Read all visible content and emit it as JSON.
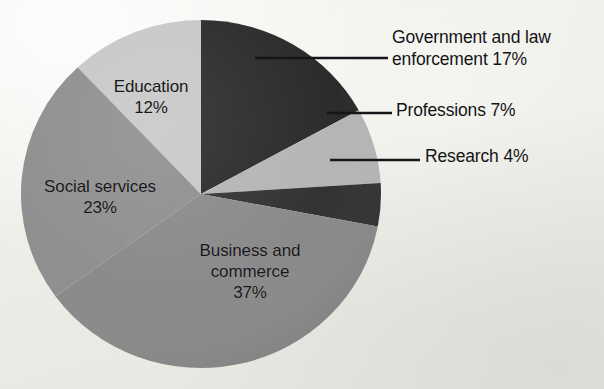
{
  "figure": {
    "background_color": "#efefea",
    "text_color": "#17171a"
  },
  "chart_data": {
    "type": "pie",
    "title": "",
    "subtitle": "",
    "xlabel": "",
    "ylabel": "",
    "legend_position": "none",
    "grid": false,
    "units": "percent",
    "total": 100,
    "start_angle_deg": 0,
    "direction": "clockwise",
    "categories": [
      "Government and law enforcement",
      "Professions",
      "Research",
      "Business and commerce",
      "Social services",
      "Education"
    ],
    "values": [
      17,
      7,
      4,
      37,
      23,
      12
    ],
    "colors": [
      "#2b2b2b",
      "#b5b5b5",
      "#333333",
      "#8a8a8a",
      "#8f8f8f",
      "#c8c8c8"
    ],
    "slices": [
      {
        "name": "Government and law enforcement",
        "value": 17,
        "label": "Government and law\nenforcement 17%",
        "percent_text": "17%",
        "color": "#2b2b2b",
        "label_placement": "callout-right",
        "start_deg": 0,
        "end_deg": 61.2
      },
      {
        "name": "Professions",
        "value": 7,
        "label": "Professions 7%",
        "percent_text": "7%",
        "color": "#b5b5b5",
        "label_placement": "callout-right",
        "start_deg": 61.2,
        "end_deg": 86.4
      },
      {
        "name": "Research",
        "value": 4,
        "label": "Research 4%",
        "percent_text": "4%",
        "color": "#333333",
        "label_placement": "callout-right",
        "start_deg": 86.4,
        "end_deg": 100.8
      },
      {
        "name": "Business and commerce",
        "value": 37,
        "label": "Business and\ncommerce\n37%",
        "percent_text": "37%",
        "color": "#8a8a8a",
        "label_placement": "inside",
        "start_deg": 100.8,
        "end_deg": 234.0
      },
      {
        "name": "Social services",
        "value": 23,
        "label": "Social services\n23%",
        "percent_text": "23%",
        "color": "#8f8f8f",
        "label_placement": "inside",
        "start_deg": 234.0,
        "end_deg": 316.8
      },
      {
        "name": "Education",
        "value": 12,
        "label": "Education\n12%",
        "percent_text": "12%",
        "color": "#c8c8c8",
        "label_placement": "inside",
        "start_deg": 316.8,
        "end_deg": 360.0
      }
    ]
  }
}
